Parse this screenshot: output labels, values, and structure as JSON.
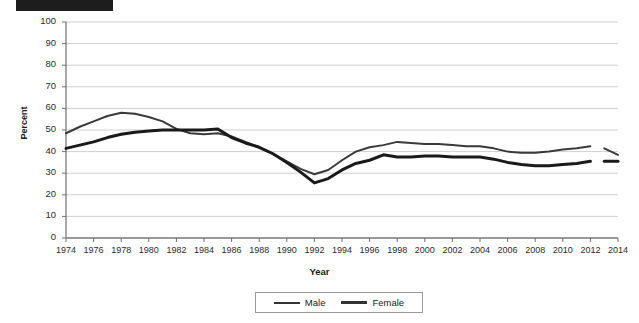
{
  "title": {
    "redacted": true,
    "faint_text": ""
  },
  "axis": {
    "y_title": "Percent",
    "x_title": "Year",
    "y_ticks": [
      0,
      10,
      20,
      30,
      40,
      50,
      60,
      70,
      80,
      90,
      100
    ],
    "x_ticks": [
      1974,
      1976,
      1978,
      1980,
      1982,
      1984,
      1986,
      1988,
      1990,
      1992,
      1994,
      1996,
      1998,
      2000,
      2002,
      2004,
      2006,
      2008,
      2010,
      2012,
      2014
    ]
  },
  "legend": {
    "position": "bottom",
    "items": [
      {
        "label": "Male",
        "color": "#3a3a3a",
        "width": 2
      },
      {
        "label": "Female",
        "color": "#1a1a1a",
        "width": 3
      }
    ]
  },
  "chart_data": {
    "type": "line",
    "title": "",
    "xlabel": "Year",
    "ylabel": "Percent",
    "xlim": [
      1974,
      2014
    ],
    "ylim": [
      0,
      100
    ],
    "ytick_step": 10,
    "xtick_step": 2,
    "grid": "horizontal",
    "series_break": {
      "after": 2012,
      "resumes": 2013,
      "note": "line break between 2012 and final 2013-2014 segment"
    },
    "x": [
      1974,
      1975,
      1976,
      1977,
      1978,
      1979,
      1980,
      1981,
      1982,
      1983,
      1984,
      1985,
      1986,
      1987,
      1988,
      1989,
      1990,
      1991,
      1992,
      1993,
      1994,
      1995,
      1996,
      1997,
      1998,
      1999,
      2000,
      2001,
      2002,
      2003,
      2004,
      2005,
      2006,
      2007,
      2008,
      2009,
      2010,
      2011,
      2012
    ],
    "series": [
      {
        "name": "Male",
        "color": "#3a3a3a",
        "values": [
          48.5,
          51.5,
          54.0,
          56.5,
          58.0,
          57.5,
          56.0,
          54.0,
          50.5,
          48.5,
          48.0,
          48.5,
          47.0,
          44.5,
          42.0,
          39.0,
          35.5,
          32.0,
          29.5,
          31.5,
          36.0,
          40.0,
          42.0,
          43.0,
          44.5,
          44.0,
          43.5,
          43.5,
          43.0,
          42.5,
          42.5,
          41.5,
          40.0,
          39.5,
          39.5,
          40.0,
          41.0,
          41.5,
          42.5
        ]
      },
      {
        "name": "Female",
        "color": "#1a1a1a",
        "values": [
          41.5,
          43.0,
          44.5,
          46.5,
          48.0,
          49.0,
          49.5,
          50.0,
          50.0,
          50.0,
          50.0,
          50.5,
          46.5,
          44.0,
          42.0,
          39.0,
          35.0,
          30.5,
          25.5,
          27.5,
          31.5,
          34.5,
          36.0,
          38.5,
          37.5,
          37.5,
          38.0,
          38.0,
          37.5,
          37.5,
          37.5,
          36.5,
          35.0,
          34.0,
          33.5,
          33.5,
          34.0,
          34.5,
          35.5
        ]
      }
    ],
    "tail_segment": {
      "x": [
        2013,
        2014
      ],
      "series": [
        {
          "name": "Male",
          "values": [
            41.5,
            38.5
          ]
        },
        {
          "name": "Female",
          "values": [
            35.5,
            35.5
          ]
        }
      ]
    }
  }
}
